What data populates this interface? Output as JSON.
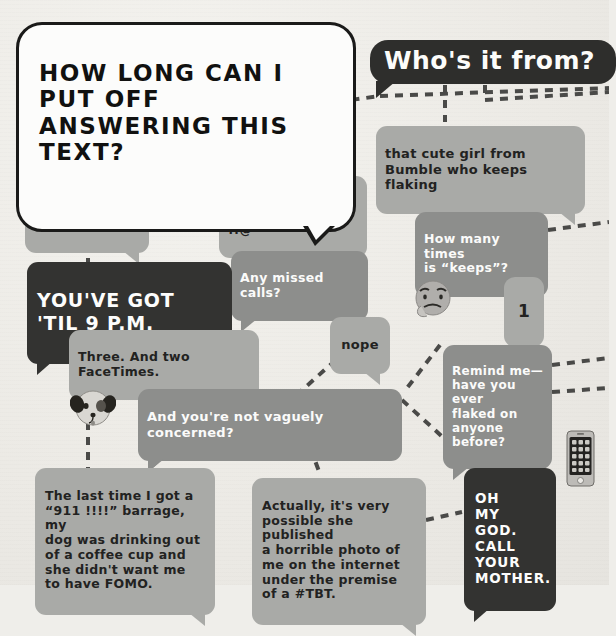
{
  "diagram": {
    "kind": "hand-drawn-flowchart",
    "background_color": "#efeeea",
    "colors": {
      "bubble_grey": "#8d8e8c",
      "bubble_light": "#a9aaa7",
      "bubble_dark": "#333331",
      "ink": "#1a1a19",
      "paper": "#efeeea",
      "connector": "#4a4a48"
    },
    "title": {
      "text": "HOW LONG CAN I PUT OFF\nANSWERING THIS TEXT?",
      "style": "white-outline-bubble"
    },
    "question2": {
      "text": "Who's it from?",
      "style": "dark-bubble-white-text"
    },
    "nodes": [
      {
        "id": "what",
        "text": "What does she\nwant?",
        "style": "grey-white"
      },
      {
        "id": "mymom",
        "text": "my mom",
        "style": "grey-dark"
      },
      {
        "id": "cute",
        "text": "that cute girl from\nBumble who keeps flaking",
        "style": "grey-dark"
      },
      {
        "id": "toknow",
        "text": "To know how\nmy day was.",
        "style": "grey-dark"
      },
      {
        "id": "idk",
        "text": "I don't know, it\njust says “SOS !!@”",
        "style": "grey-dark"
      },
      {
        "id": "howmany",
        "text": "How many times\nis “keeps”?",
        "style": "grey-white"
      },
      {
        "id": "amc",
        "text": "Any missed calls?",
        "style": "grey-white"
      },
      {
        "id": "youvegot",
        "text": "YOU'VE GOT 'TIL 9 P.M.",
        "style": "dark-white"
      },
      {
        "id": "one",
        "text": "1",
        "style": "grey-dark"
      },
      {
        "id": "three",
        "text": "Three. And two FaceTimes.",
        "style": "grey-dark"
      },
      {
        "id": "nope",
        "text": "nope",
        "style": "grey-dark"
      },
      {
        "id": "remind",
        "text": "Remind me—\nhave you ever\nflaked on\nanyone before?",
        "style": "grey-white"
      },
      {
        "id": "vaguely",
        "text": "And you're not vaguely concerned?",
        "style": "grey-white"
      },
      {
        "id": "last",
        "text": "The last time I got a\n“911 !!!!” barrage, my\ndog was drinking out\nof a coffee cup and\nshe didn't want me\nto have FOMO.",
        "style": "grey-dark"
      },
      {
        "id": "actually",
        "text": "Actually, it's very\npossible she published\na horrible photo of\nme on the internet\nunder the premise\nof a #TBT.",
        "style": "grey-dark"
      },
      {
        "id": "omg",
        "text": "OH\nMY\nGOD.\nCALL YOUR\nMOTHER.",
        "style": "dark-white"
      }
    ],
    "doodles": [
      {
        "id": "dog",
        "name": "dog-face-doodle"
      },
      {
        "id": "thinker",
        "name": "thinking-face-doodle"
      },
      {
        "id": "phone",
        "name": "smartphone-doodle"
      }
    ],
    "connectors": [
      {
        "x1": 88,
        "y1": 95,
        "x2": 88,
        "y2": 108
      },
      {
        "x1": 157,
        "y1": 128,
        "x2": 196,
        "y2": 112
      },
      {
        "x1": 157,
        "y1": 150,
        "x2": 222,
        "y2": 188
      },
      {
        "x1": 88,
        "y1": 160,
        "x2": 88,
        "y2": 182
      },
      {
        "x1": 88,
        "y1": 228,
        "x2": 88,
        "y2": 262
      },
      {
        "x1": 88,
        "y1": 302,
        "x2": 88,
        "y2": 470
      },
      {
        "x1": 292,
        "y1": 108,
        "x2": 380,
        "y2": 96
      },
      {
        "x1": 380,
        "y1": 96,
        "x2": 609,
        "y2": 88
      },
      {
        "x1": 445,
        "y1": 85,
        "x2": 445,
        "y2": 122
      },
      {
        "x1": 485,
        "y1": 85,
        "x2": 485,
        "y2": 100
      },
      {
        "x1": 485,
        "y1": 100,
        "x2": 609,
        "y2": 92
      },
      {
        "x1": 480,
        "y1": 165,
        "x2": 480,
        "y2": 210
      },
      {
        "x1": 548,
        "y1": 230,
        "x2": 609,
        "y2": 222
      },
      {
        "x1": 480,
        "y1": 252,
        "x2": 480,
        "y2": 276
      },
      {
        "x1": 524,
        "y1": 307,
        "x2": 524,
        "y2": 345
      },
      {
        "x1": 552,
        "y1": 365,
        "x2": 609,
        "y2": 358
      },
      {
        "x1": 552,
        "y1": 392,
        "x2": 609,
        "y2": 388
      },
      {
        "x1": 295,
        "y1": 214,
        "x2": 295,
        "y2": 250
      },
      {
        "x1": 255,
        "y1": 283,
        "x2": 162,
        "y2": 330
      },
      {
        "x1": 340,
        "y1": 283,
        "x2": 352,
        "y2": 316
      },
      {
        "x1": 165,
        "y1": 360,
        "x2": 165,
        "y2": 388
      },
      {
        "x1": 358,
        "y1": 340,
        "x2": 300,
        "y2": 392
      },
      {
        "x1": 200,
        "y1": 420,
        "x2": 152,
        "y2": 466
      },
      {
        "x1": 300,
        "y1": 420,
        "x2": 320,
        "y2": 474
      },
      {
        "x1": 402,
        "y1": 400,
        "x2": 470,
        "y2": 462
      },
      {
        "x1": 426,
        "y1": 520,
        "x2": 462,
        "y2": 512
      },
      {
        "x1": 440,
        "y1": 345,
        "x2": 404,
        "y2": 392
      }
    ]
  }
}
